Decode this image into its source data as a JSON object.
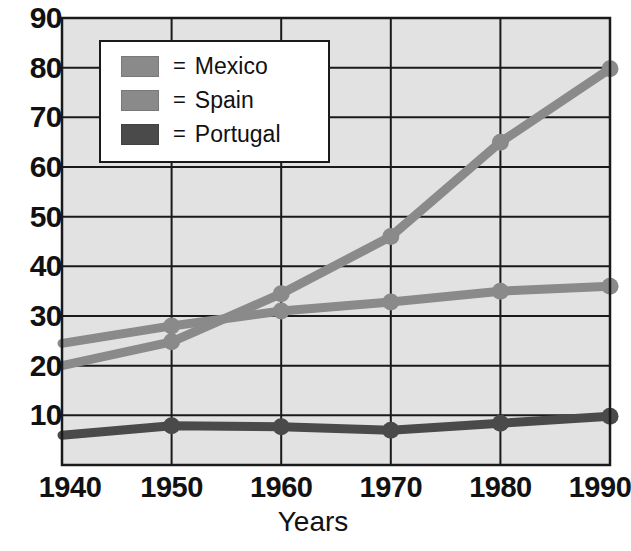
{
  "chart_data": {
    "type": "line",
    "title": "",
    "xlabel": "Years",
    "ylabel": "",
    "categories": [
      1940,
      1950,
      1960,
      1970,
      1980,
      1990
    ],
    "x": [
      1940,
      1950,
      1960,
      1970,
      1980,
      1990
    ],
    "xtick_labels": [
      "1940",
      "1950",
      "1960",
      "1970",
      "1980",
      "1990"
    ],
    "ytick_labels": [
      "10",
      "20",
      "30",
      "40",
      "50",
      "60",
      "70",
      "80",
      "90"
    ],
    "yticks": [
      10,
      20,
      30,
      40,
      50,
      60,
      70,
      80,
      90
    ],
    "xlim": [
      1940,
      1990
    ],
    "ylim": [
      0,
      90
    ],
    "grid": true,
    "legend_position": "top-left-inside",
    "series": [
      {
        "name": "Mexico",
        "color": "#8a8a8a",
        "values": [
          20,
          24.8,
          34.5,
          46,
          65,
          79.8
        ]
      },
      {
        "name": "Spain",
        "color": "#8a8a8a",
        "values": [
          24.5,
          28,
          31,
          32.8,
          35,
          36
        ]
      },
      {
        "name": "Portugal",
        "color": "#4a4a4a",
        "values": [
          6,
          7.9,
          7.7,
          7,
          8.4,
          9.8
        ]
      }
    ]
  },
  "legend": {
    "equals_symbol": "=",
    "entries": [
      {
        "label": "Mexico",
        "color": "#8a8a8a"
      },
      {
        "label": "Spain",
        "color": "#8a8a8a"
      },
      {
        "label": "Portugal",
        "color": "#4a4a4a"
      }
    ]
  },
  "axes": {
    "x_title": "Years"
  },
  "style": {
    "plot_background": "#e2e2e2",
    "axis_color": "#1a1a1a",
    "grid_color": "#1a1a1a",
    "text_color": "#111111"
  }
}
